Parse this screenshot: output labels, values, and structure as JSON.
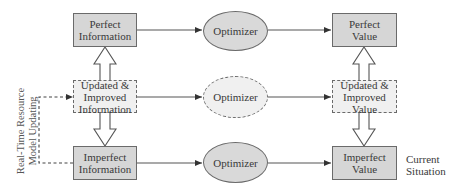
{
  "diagram": {
    "rows": [
      {
        "name": "perfect",
        "input": "Perfect\nInformation",
        "process": "Optimizer",
        "output": "Perfect\nValue",
        "style": "solid"
      },
      {
        "name": "updated",
        "input": "Updated &\nImproved\nInformation",
        "process": "Optimizer",
        "output": "Updated &\nImproved\nValue",
        "style": "dashed"
      },
      {
        "name": "imperfect",
        "input": "Imperfect\nInformation",
        "process": "Optimizer",
        "output": "Imperfect\nValue",
        "style": "solid"
      }
    ],
    "side_label": "Real-Time Resource\nModel Updating",
    "current_situation_label": "Current\nSituation",
    "colors": {
      "box_fill": "#d6d6d6",
      "dashed_fill": "#f0f0f0",
      "stroke": "#6a6a6a",
      "arrow": "#333333"
    }
  }
}
